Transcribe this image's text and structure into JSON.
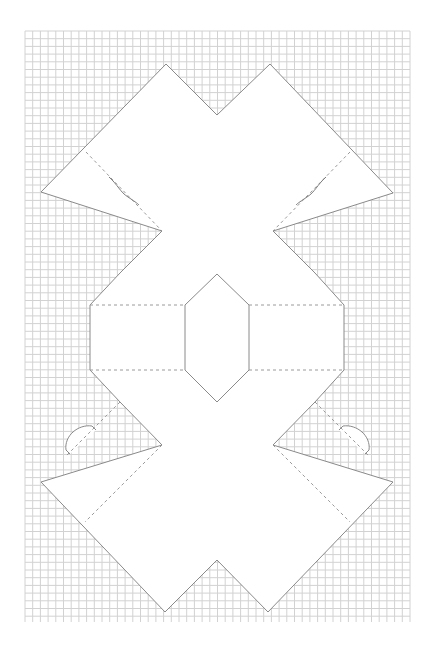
{
  "figure": {
    "type": "papercraft-template",
    "background": "#ffffff",
    "grid": {
      "x0": 25,
      "y0": 31,
      "x1": 410,
      "y1": 622,
      "spacing": 7.7,
      "color": "#d2d2d2"
    },
    "outline_color": "#8a8a8a",
    "fold_color": "#9a9a9a",
    "outline_points": [
      [
        166,
        64
      ],
      [
        217,
        115
      ],
      [
        270,
        64
      ],
      [
        393,
        193
      ],
      [
        273,
        231
      ],
      [
        315,
        273
      ],
      [
        344,
        305
      ],
      [
        344,
        370
      ],
      [
        315,
        402
      ],
      [
        273,
        445
      ],
      [
        393,
        482
      ],
      [
        268,
        612
      ],
      [
        217,
        560
      ],
      [
        165,
        612
      ],
      [
        41,
        482
      ],
      [
        162,
        445
      ],
      [
        120,
        402
      ],
      [
        90,
        370
      ],
      [
        90,
        305
      ],
      [
        120,
        273
      ],
      [
        162,
        231
      ],
      [
        41,
        192
      ]
    ],
    "fold_lines": [
      [
        [
          86,
          152
        ],
        [
          162,
          231
        ]
      ],
      [
        [
          350,
          152
        ],
        [
          273,
          231
        ]
      ],
      [
        [
          90,
          305
        ],
        [
          185,
          305
        ]
      ],
      [
        [
          249,
          305
        ],
        [
          344,
          305
        ]
      ],
      [
        [
          90,
          370
        ],
        [
          185,
          370
        ]
      ],
      [
        [
          249,
          370
        ],
        [
          344,
          370
        ]
      ],
      [
        [
          162,
          445
        ],
        [
          85,
          522
        ]
      ],
      [
        [
          273,
          445
        ],
        [
          350,
          522
        ]
      ],
      [
        [
          120,
          402
        ],
        [
          65,
          457
        ]
      ],
      [
        [
          315,
          402
        ],
        [
          370,
          457
        ]
      ]
    ],
    "center_diamond": [
      [
        185,
        305
      ],
      [
        217,
        274
      ],
      [
        249,
        305
      ],
      [
        249,
        370
      ],
      [
        217,
        402
      ],
      [
        185,
        370
      ]
    ],
    "slits": [
      "M109 177 C 118 185, 120 192, 128 197 C 134 201, 137 203, 139 205",
      "M326 177 C 317 185, 315 192, 307 197 C 301 201, 298 203, 296 205"
    ],
    "tabs": [
      "M70 454 L66 450 C 64 436, 78 424, 92 426 L96 430",
      "M365 454 L369 450 C 371 436, 357 424, 343 426 L339 430"
    ]
  }
}
